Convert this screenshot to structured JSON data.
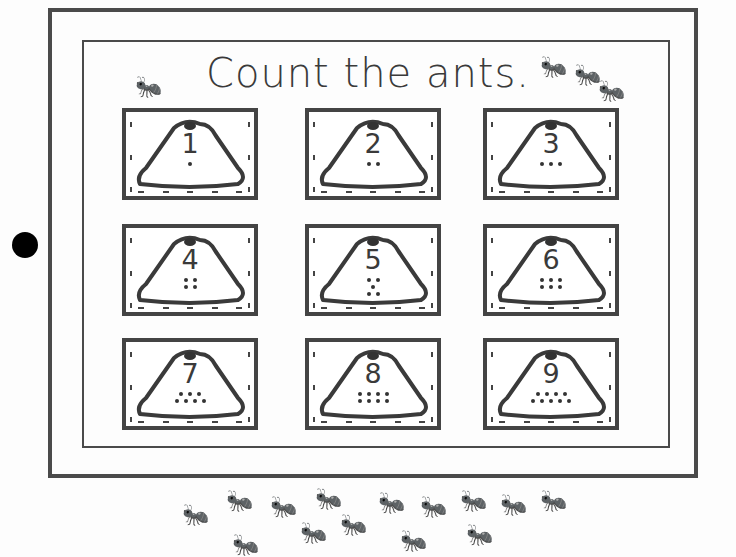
{
  "worksheet": {
    "title": "Count the ants.",
    "cards": [
      {
        "number": "1",
        "dots": [
          1
        ]
      },
      {
        "number": "2",
        "dots": [
          2
        ]
      },
      {
        "number": "3",
        "dots": [
          3
        ]
      },
      {
        "number": "4",
        "dots": [
          2,
          2
        ]
      },
      {
        "number": "5",
        "dots": [
          2,
          1,
          2
        ]
      },
      {
        "number": "6",
        "dots": [
          3,
          3
        ]
      },
      {
        "number": "7",
        "dots": [
          3,
          4
        ]
      },
      {
        "number": "8",
        "dots": [
          4,
          4
        ]
      },
      {
        "number": "9",
        "dots": [
          4,
          5
        ]
      }
    ],
    "ant_count_bottom": 14,
    "colors": {
      "ink": "#3a3a3a",
      "paper": "#fdfdfd"
    }
  }
}
